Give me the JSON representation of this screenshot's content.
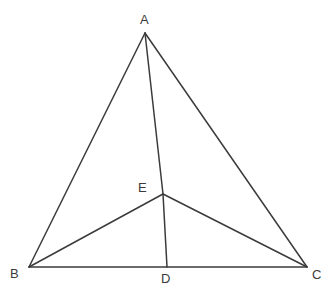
{
  "figure": {
    "kind": "geometry-diagram",
    "background_color": "#ffffff",
    "stroke_color": "#3b3b3b",
    "stroke_width": 1.5,
    "label_color": "#3b3b3b",
    "label_font_size": 13,
    "canvas": {
      "width": 331,
      "height": 302
    },
    "points": {
      "A": {
        "name": "A",
        "x": 145,
        "y": 33
      },
      "B": {
        "name": "B",
        "x": 29,
        "y": 267
      },
      "C": {
        "name": "C",
        "x": 307,
        "y": 267
      },
      "D": {
        "name": "D",
        "x": 167,
        "y": 267
      },
      "E": {
        "name": "E",
        "x": 163,
        "y": 194
      }
    },
    "labels": [
      {
        "text": "A",
        "x": 140,
        "y": 13
      },
      {
        "text": "B",
        "x": 10,
        "y": 267
      },
      {
        "text": "C",
        "x": 312,
        "y": 268
      },
      {
        "text": "D",
        "x": 161,
        "y": 272
      },
      {
        "text": "E",
        "x": 138,
        "y": 181
      }
    ],
    "segments": [
      {
        "name": "AB",
        "from": "A",
        "to": "B"
      },
      {
        "name": "AC",
        "from": "A",
        "to": "C"
      },
      {
        "name": "BC",
        "from": "B",
        "to": "C"
      },
      {
        "name": "AE",
        "from": "A",
        "to": "E"
      },
      {
        "name": "ED",
        "from": "E",
        "to": "D"
      },
      {
        "name": "BE",
        "from": "B",
        "to": "E"
      },
      {
        "name": "EC",
        "from": "E",
        "to": "C"
      }
    ]
  }
}
